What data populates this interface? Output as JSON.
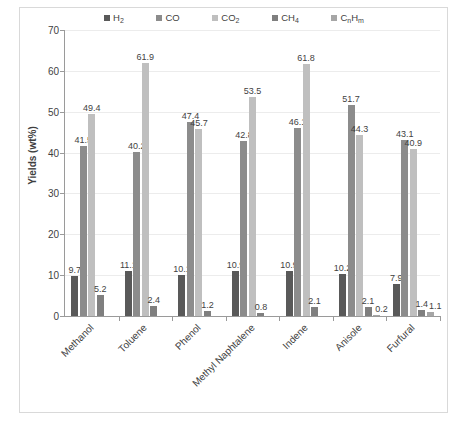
{
  "chart": {
    "type": "bar",
    "ylabel": "Yields (wt%)",
    "xlabel": ""
  },
  "legend": {
    "position": "top",
    "items": [
      {
        "label": "H2",
        "display": "H",
        "sub": "2",
        "color": "#595959"
      },
      {
        "label": "CO",
        "display": "CO",
        "sub": "",
        "color": "#8c8c8c"
      },
      {
        "label": "CO2",
        "display": "CO",
        "sub": "2",
        "color": "#bfbfbf"
      },
      {
        "label": "CH4",
        "display": "CH",
        "sub": "4",
        "color": "#7f7f7f"
      },
      {
        "label": "CnHm",
        "display": "C",
        "sub": "n",
        "display2": "H",
        "sub2": "m",
        "color": "#a6a6a6"
      }
    ]
  },
  "yaxis": {
    "min": 0,
    "max": 70,
    "step": 10,
    "ticks": [
      "0",
      "10",
      "20",
      "30",
      "40",
      "50",
      "60",
      "70"
    ]
  },
  "chart_data": {
    "type": "bar",
    "title": "",
    "xlabel": "",
    "ylabel": "Yields (wt%)",
    "ylim": [
      0,
      70
    ],
    "grid": true,
    "legend_position": "top",
    "categories": [
      "Methanol",
      "Toluene",
      "Phenol",
      "Methyl Naphtalene",
      "Indene",
      "Anisole",
      "Furfural"
    ],
    "series": [
      {
        "name": "H2",
        "color": "#595959",
        "values": [
          9.7,
          11.1,
          10.1,
          10.9,
          10.9,
          10.2,
          7.9
        ]
      },
      {
        "name": "CO",
        "color": "#8c8c8c",
        "values": [
          41.5,
          40.2,
          47.4,
          42.8,
          46.1,
          51.7,
          43.1
        ]
      },
      {
        "name": "CO2",
        "color": "#bfbfbf",
        "values": [
          49.4,
          61.9,
          45.7,
          53.5,
          61.8,
          44.3,
          40.9
        ]
      },
      {
        "name": "CH4",
        "color": "#7f7f7f",
        "values": [
          5.2,
          2.4,
          1.2,
          0.8,
          2.1,
          2.1,
          1.4
        ]
      },
      {
        "name": "CnHm",
        "color": "#a6a6a6",
        "values": [
          0,
          0,
          0,
          0,
          0,
          0.2,
          1.1
        ]
      }
    ],
    "data_labels": {
      "Methanol": [
        "9.7",
        "41.5",
        "49.4",
        "5.2",
        ""
      ],
      "Toluene": [
        "11.1",
        "40.2",
        "61.9",
        "2.4",
        ""
      ],
      "Phenol": [
        "10.1",
        "47.4",
        "45.7",
        "1.2",
        ""
      ],
      "Methyl Naphtalene": [
        "10.9",
        "42.8",
        "53.5",
        "0.8",
        ""
      ],
      "Indene": [
        "10.9",
        "46.1",
        "61.8",
        "2.1",
        ""
      ],
      "Anisole": [
        "10.2",
        "51.7",
        "44.3",
        "2.1",
        "0.2"
      ],
      "Furfural": [
        "7.9",
        "43.1",
        "40.9",
        "1.4",
        "1.1"
      ]
    }
  }
}
